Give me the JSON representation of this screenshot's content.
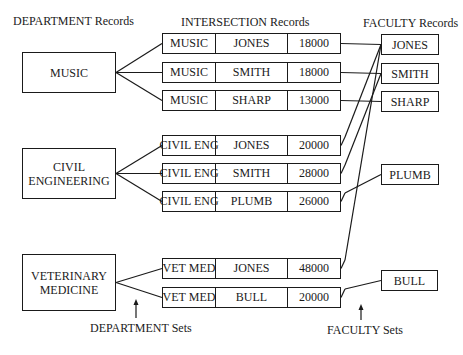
{
  "headers": {
    "department": "DEPARTMENT Records",
    "intersection": "INTERSECTION Records",
    "faculty": "FACULTY Records"
  },
  "departments": [
    {
      "id": "music",
      "lines": [
        "MUSIC"
      ]
    },
    {
      "id": "civil",
      "lines": [
        "CIVIL",
        "ENGINEERING"
      ]
    },
    {
      "id": "vet",
      "lines": [
        "VETERINARY",
        "MEDICINE"
      ]
    }
  ],
  "intersections": [
    {
      "dept": "MUSIC",
      "faculty": "JONES",
      "salary": "18000",
      "dept_id": "music",
      "fac_id": "jones"
    },
    {
      "dept": "MUSIC",
      "faculty": "SMITH",
      "salary": "18000",
      "dept_id": "music",
      "fac_id": "smith"
    },
    {
      "dept": "MUSIC",
      "faculty": "SHARP",
      "salary": "13000",
      "dept_id": "music",
      "fac_id": "sharp"
    },
    {
      "dept": "CIVIL ENG",
      "faculty": "JONES",
      "salary": "20000",
      "dept_id": "civil",
      "fac_id": "jones"
    },
    {
      "dept": "CIVIL ENG",
      "faculty": "SMITH",
      "salary": "28000",
      "dept_id": "civil",
      "fac_id": "smith"
    },
    {
      "dept": "CIVIL ENG",
      "faculty": "PLUMB",
      "salary": "26000",
      "dept_id": "civil",
      "fac_id": "plumb"
    },
    {
      "dept": "VET MED",
      "faculty": "JONES",
      "salary": "48000",
      "dept_id": "vet",
      "fac_id": "jones"
    },
    {
      "dept": "VET MED",
      "faculty": "BULL",
      "salary": "20000",
      "dept_id": "vet",
      "fac_id": "bull"
    }
  ],
  "faculty": [
    {
      "id": "jones",
      "name": "JONES"
    },
    {
      "id": "smith",
      "name": "SMITH"
    },
    {
      "id": "sharp",
      "name": "SHARP"
    },
    {
      "id": "plumb",
      "name": "PLUMB"
    },
    {
      "id": "bull",
      "name": "BULL"
    }
  ],
  "annotations": {
    "department_sets": "DEPARTMENT Sets",
    "faculty_sets": "FACULTY Sets"
  }
}
